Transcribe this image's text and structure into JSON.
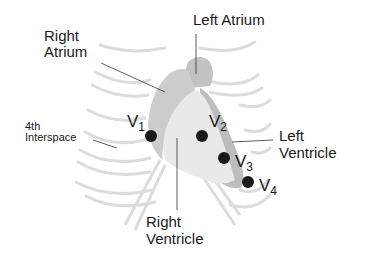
{
  "diagram": {
    "type": "anatomical diagram - precordial ECG lead placement",
    "labels": {
      "left_atrium": "Left Atrium",
      "right_atrium_line1": "Right",
      "right_atrium_line2": "Atrium",
      "interspace_line1": "4th",
      "interspace_line2": "Interspace",
      "left_ventricle_line1": "Left",
      "left_ventricle_line2": "Ventricle",
      "right_ventricle_line1": "Right",
      "right_ventricle_line2": "Ventricle"
    },
    "leads": [
      {
        "letter": "V",
        "sub": "1"
      },
      {
        "letter": "V",
        "sub": "2"
      },
      {
        "letter": "V",
        "sub": "3"
      },
      {
        "letter": "V",
        "sub": "4"
      }
    ],
    "colors": {
      "ribs": "#d9d9d9",
      "atrium_dark": "#b8b8b8",
      "right_atrium": "#cfcfcf",
      "right_ventricle": "#e8e8e8",
      "left_ventricle": "#c4c4c4",
      "electrode": "#1a1a1a"
    }
  }
}
